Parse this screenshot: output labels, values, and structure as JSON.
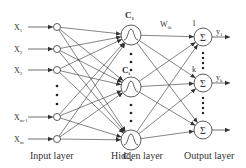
{
  "diagram": {
    "inputs": [
      {
        "label": "X",
        "sub": "1",
        "y": 27
      },
      {
        "label": "X",
        "sub": "2",
        "y": 49
      },
      {
        "label": "X",
        "sub": "3",
        "y": 70
      },
      {
        "label": "X",
        "sub": "m-1",
        "y": 117
      },
      {
        "label": "X",
        "sub": "m",
        "y": 139
      }
    ],
    "hidden": [
      {
        "label": "C",
        "sub": "1",
        "y": 35
      },
      {
        "label": "C",
        "sub": "i",
        "y": 87
      },
      {
        "label": "C",
        "sub": "n",
        "y": 140
      }
    ],
    "outputs": [
      {
        "symbol": "Σ",
        "index_label": "1",
        "out_label": "y",
        "out_sub": "1",
        "y": 37
      },
      {
        "symbol": "Σ",
        "index_label": "k",
        "out_label": "y",
        "out_sub": "k",
        "y": 83
      },
      {
        "symbol": "Σ",
        "index_label": "",
        "out_label": "",
        "out_sub": "",
        "y": 130
      }
    ],
    "weight_label": "W",
    "weight_sub": "ik",
    "layers": {
      "input": "Input layer",
      "hidden": "Hidden layer",
      "output": "Output layer"
    },
    "colors": {
      "stroke": "#333333",
      "background": "#ffffff"
    }
  }
}
